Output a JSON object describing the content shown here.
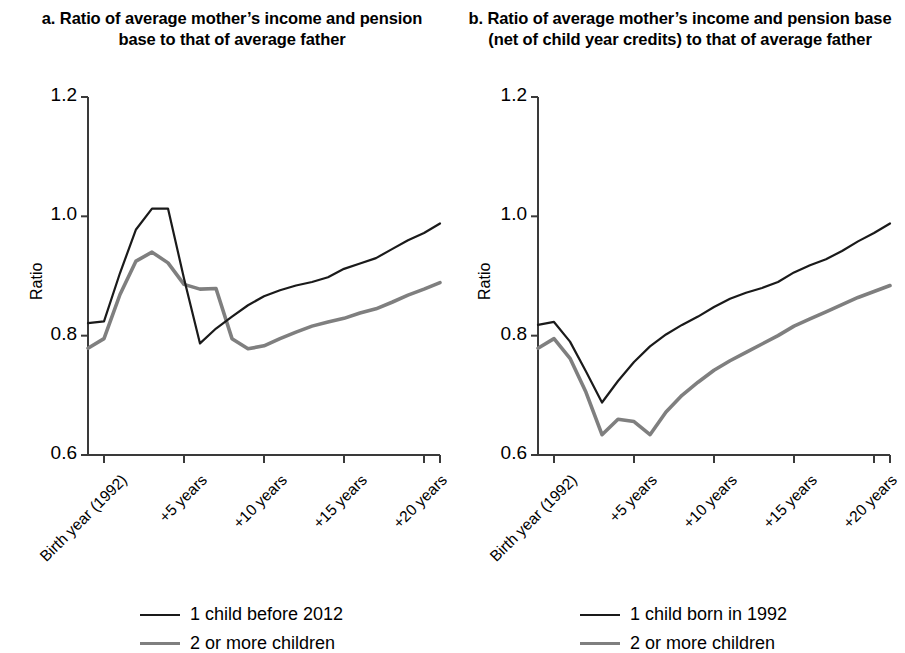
{
  "figure": {
    "panels": [
      {
        "id": "a",
        "title": "a. Ratio of average mother’s income and pension base to that of average father",
        "ylabel": "Ratio",
        "legend": [
          {
            "label": "1 child before 2012",
            "color": "#1a1a1a"
          },
          {
            "label": "2 or more children",
            "color": "#7f7f7f"
          }
        ]
      },
      {
        "id": "b",
        "title": "b. Ratio of average mother’s income and pension base (net of child year credits) to that of average father",
        "ylabel": "Ratio",
        "legend": [
          {
            "label": "1 child born in 1992",
            "color": "#1a1a1a"
          },
          {
            "label": "2 or more children",
            "color": "#7f7f7f"
          }
        ]
      }
    ]
  },
  "chart_data": [
    {
      "type": "line",
      "panel": "a",
      "title": "a. Ratio of average mother’s income and pension base to that of average father",
      "xlabel": "",
      "ylabel": "Ratio",
      "ylim": [
        0.6,
        1.2
      ],
      "yticks": [
        0.6,
        0.8,
        1.0,
        1.2
      ],
      "ytick_labels": [
        "0.6",
        "0.8",
        "1.0",
        "1.2"
      ],
      "grid": false,
      "legend_position": "bottom",
      "x": [
        -1,
        0,
        1,
        2,
        3,
        4,
        5,
        6,
        7,
        8,
        9,
        10,
        11,
        12,
        13,
        14,
        15,
        16,
        17,
        18,
        19,
        20,
        21
      ],
      "xticks": [
        0,
        5,
        10,
        15,
        20
      ],
      "xtick_labels": [
        "Birth year (1992)",
        "+5 years",
        "+10 years",
        "+15 years",
        "+20 years"
      ],
      "series": [
        {
          "name": "1 child before 2012",
          "color": "#1a1a1a",
          "values": [
            0.821,
            0.824,
            0.905,
            0.978,
            1.013,
            1.013,
            0.896,
            0.787,
            0.812,
            0.832,
            0.851,
            0.866,
            0.876,
            0.884,
            0.89,
            0.898,
            0.912,
            0.921,
            0.93,
            0.945,
            0.96,
            0.972,
            0.988
          ]
        },
        {
          "name": "2 or more children",
          "color": "#7f7f7f",
          "values": [
            0.779,
            0.795,
            0.869,
            0.925,
            0.94,
            0.922,
            0.886,
            0.878,
            0.879,
            0.795,
            0.778,
            0.783,
            0.795,
            0.806,
            0.816,
            0.823,
            0.829,
            0.838,
            0.845,
            0.856,
            0.868,
            0.878,
            0.889
          ]
        }
      ]
    },
    {
      "type": "line",
      "panel": "b",
      "title": "b. Ratio of average mother’s income and pension base (net of child year credits) to that of average father",
      "xlabel": "",
      "ylabel": "Ratio",
      "ylim": [
        0.6,
        1.2
      ],
      "yticks": [
        0.6,
        0.8,
        1.0,
        1.2
      ],
      "ytick_labels": [
        "0.6",
        "0.8",
        "1.0",
        "1.2"
      ],
      "grid": false,
      "legend_position": "bottom",
      "x": [
        -1,
        0,
        1,
        2,
        3,
        4,
        5,
        6,
        7,
        8,
        9,
        10,
        11,
        12,
        13,
        14,
        15,
        16,
        17,
        18,
        19,
        20,
        21
      ],
      "xticks": [
        0,
        5,
        10,
        15,
        20
      ],
      "xtick_labels": [
        "Birth year (1992)",
        "+5 years",
        "+10 years",
        "+15 years",
        "+20 years"
      ],
      "series": [
        {
          "name": "1 child born in 1992",
          "color": "#1a1a1a",
          "values": [
            0.818,
            0.823,
            0.79,
            0.74,
            0.688,
            0.724,
            0.756,
            0.782,
            0.802,
            0.818,
            0.832,
            0.848,
            0.862,
            0.872,
            0.88,
            0.89,
            0.906,
            0.918,
            0.928,
            0.942,
            0.958,
            0.972,
            0.988
          ]
        },
        {
          "name": "2 or more children",
          "color": "#7f7f7f",
          "values": [
            0.779,
            0.795,
            0.762,
            0.705,
            0.634,
            0.66,
            0.656,
            0.634,
            0.672,
            0.7,
            0.722,
            0.742,
            0.758,
            0.772,
            0.786,
            0.8,
            0.816,
            0.828,
            0.84,
            0.852,
            0.864,
            0.874,
            0.884
          ]
        }
      ]
    }
  ]
}
